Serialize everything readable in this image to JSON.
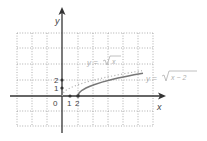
{
  "diagram": {
    "type": "function-graph",
    "axes": {
      "x_label": "x",
      "y_label": "y",
      "origin_label": "0",
      "x_ticks": [
        {
          "value": 1,
          "label": "1"
        },
        {
          "value": 2,
          "label": "2"
        }
      ],
      "y_ticks": [
        {
          "value": 1,
          "label": "1"
        },
        {
          "value": 2,
          "label": "2"
        }
      ]
    },
    "grid": {
      "style": "dotted",
      "visible": true
    },
    "curves": [
      {
        "name": "sqrt-x",
        "label": "y = √x",
        "label_prefix": "y =",
        "radicand": "x",
        "style": "dotted",
        "color": "#b8b8b8",
        "domain": [
          0,
          10
        ]
      },
      {
        "name": "sqrt-x-minus-2",
        "label": "y = √(x − 2)",
        "label_prefix": "y =",
        "radicand": "x − 2",
        "style": "solid",
        "color": "#777777",
        "domain": [
          2,
          10.1
        ]
      }
    ],
    "colors": {
      "axis": "#333333",
      "grid": "#9a9a9a",
      "label_light": "#b0b0b0",
      "text": "#444444"
    }
  }
}
